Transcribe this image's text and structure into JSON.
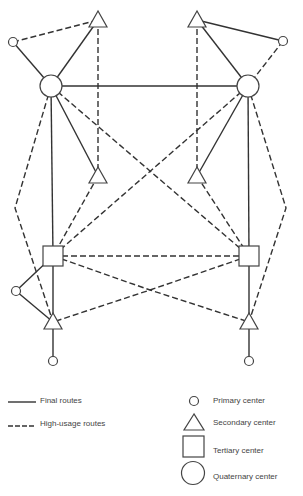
{
  "diagram": {
    "title": "",
    "route_types": {
      "final": "Final routes",
      "high_usage": "High-usage routes"
    },
    "nodes": [
      {
        "id": "Q-L",
        "type": "quaternary"
      },
      {
        "id": "Q-R",
        "type": "quaternary"
      },
      {
        "id": "S-TL",
        "type": "secondary"
      },
      {
        "id": "S-TR",
        "type": "secondary"
      },
      {
        "id": "P-TL",
        "type": "primary"
      },
      {
        "id": "P-TR",
        "type": "primary"
      },
      {
        "id": "S-ML",
        "type": "secondary"
      },
      {
        "id": "S-MR",
        "type": "secondary"
      },
      {
        "id": "T-L",
        "type": "tertiary"
      },
      {
        "id": "T-R",
        "type": "tertiary"
      },
      {
        "id": "S-BL",
        "type": "secondary"
      },
      {
        "id": "S-BR",
        "type": "secondary"
      },
      {
        "id": "P-BL",
        "type": "primary"
      },
      {
        "id": "P-BR",
        "type": "primary"
      },
      {
        "id": "P-ML",
        "type": "primary"
      }
    ],
    "edges": [
      {
        "from": "P-TL",
        "to": "Q-L",
        "route": "final"
      },
      {
        "from": "S-TL",
        "to": "Q-L",
        "route": "final"
      },
      {
        "from": "P-TL",
        "to": "S-TL",
        "route": "high_usage"
      },
      {
        "from": "S-TL",
        "to": "S-ML",
        "route": "high_usage"
      },
      {
        "from": "Q-L",
        "to": "Q-R",
        "route": "final"
      },
      {
        "from": "Q-L",
        "to": "S-ML",
        "route": "final"
      },
      {
        "from": "Q-L",
        "to": "T-L",
        "route": "final"
      },
      {
        "from": "Q-L",
        "to": "T-R",
        "route": "high_usage"
      },
      {
        "from": "Q-L",
        "to": "S-BL",
        "route": "high_usage",
        "via": "left-bend"
      },
      {
        "from": "P-TR",
        "to": "Q-R",
        "route": "high_usage"
      },
      {
        "from": "S-TR",
        "to": "Q-R",
        "route": "final"
      },
      {
        "from": "S-TR",
        "to": "P-TR",
        "route": "final"
      },
      {
        "from": "S-TR",
        "to": "S-MR",
        "route": "high_usage"
      },
      {
        "from": "Q-R",
        "to": "S-MR",
        "route": "final"
      },
      {
        "from": "Q-R",
        "to": "T-R",
        "route": "final"
      },
      {
        "from": "Q-R",
        "to": "T-L",
        "route": "high_usage"
      },
      {
        "from": "Q-R",
        "to": "S-BR",
        "route": "high_usage",
        "via": "right-bend"
      },
      {
        "from": "S-ML",
        "to": "T-L",
        "route": "high_usage"
      },
      {
        "from": "S-MR",
        "to": "T-R",
        "route": "high_usage"
      },
      {
        "from": "T-L",
        "to": "T-R",
        "route": "high_usage"
      },
      {
        "from": "T-L",
        "to": "S-BR",
        "route": "high_usage"
      },
      {
        "from": "T-R",
        "to": "S-BL",
        "route": "high_usage"
      },
      {
        "from": "T-L",
        "to": "S-BL",
        "route": "final"
      },
      {
        "from": "T-R",
        "to": "S-BR",
        "route": "final"
      },
      {
        "from": "T-L",
        "to": "P-ML",
        "route": "final"
      },
      {
        "from": "P-ML",
        "to": "S-BL",
        "route": "final"
      },
      {
        "from": "S-BL",
        "to": "P-BL",
        "route": "final"
      },
      {
        "from": "S-BR",
        "to": "P-BR",
        "route": "final"
      }
    ]
  },
  "legend": {
    "lines": [
      {
        "style": "final",
        "label": "Final routes"
      },
      {
        "style": "high_usage",
        "label": "High-usage routes"
      }
    ],
    "symbols": [
      {
        "shape": "circle-small",
        "label": "Primary center"
      },
      {
        "shape": "triangle",
        "label": "Secondary center"
      },
      {
        "shape": "square",
        "label": "Tertiary center"
      },
      {
        "shape": "circle-large",
        "label": "Quaternary center"
      }
    ]
  }
}
